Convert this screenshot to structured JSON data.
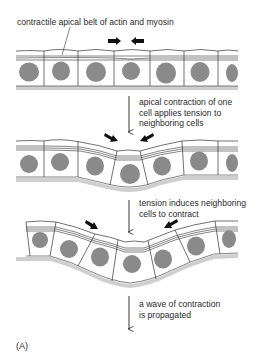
{
  "figure": {
    "panel_label": "(A)",
    "colors": {
      "nucleus": "#8a8a8a",
      "basal_lamina": "#cfcfcf",
      "outline": "#333333",
      "arrow": "#111111",
      "background": "#ffffff"
    },
    "stages": [
      {
        "id": "stage-1",
        "label": "contractile apical belt of actin and myosin",
        "description": "flat epithelial sheet with apical belt; paired arrows point inward at one cell"
      },
      {
        "id": "stage-2",
        "label_lines": [
          "apical contraction of one",
          "cell applies tension to",
          "neighboring cells"
        ],
        "description": "central cell constricts apically, sheet begins to bend"
      },
      {
        "id": "stage-3",
        "label_lines": [
          "tension induces neighboring",
          "cells to contract"
        ],
        "description": "neighboring cells constrict, sheet bends further"
      },
      {
        "id": "stage-4",
        "label_lines": [
          "a wave of contraction",
          "is propagated"
        ]
      }
    ]
  }
}
